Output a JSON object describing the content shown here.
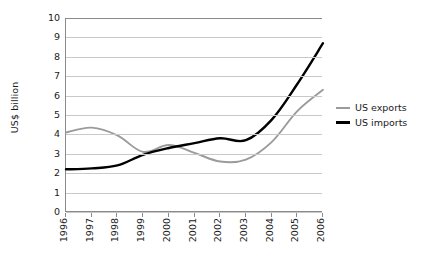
{
  "chart_data": {
    "type": "line",
    "title": "",
    "xlabel": "",
    "ylabel": "US$ billion",
    "categories": [
      "1996",
      "1997",
      "1998",
      "1999",
      "2000",
      "2001",
      "2002",
      "2003",
      "2004",
      "2005",
      "2006"
    ],
    "x": [
      1996,
      1997,
      1998,
      1999,
      2000,
      2001,
      2002,
      2003,
      2004,
      2005,
      2006
    ],
    "series": [
      {
        "name": "US exports",
        "color": "#9b9b9b",
        "values": [
          4.1,
          4.35,
          3.95,
          3.1,
          3.45,
          3.05,
          2.6,
          2.7,
          3.6,
          5.2,
          6.3
        ]
      },
      {
        "name": "US imports",
        "color": "#000000",
        "values": [
          2.2,
          2.25,
          2.4,
          2.95,
          3.3,
          3.55,
          3.8,
          3.7,
          4.75,
          6.6,
          8.7
        ]
      }
    ],
    "ylim": [
      0,
      10
    ],
    "yticks": [
      "0",
      "1",
      "2",
      "3",
      "4",
      "5",
      "6",
      "7",
      "8",
      "9",
      "10"
    ],
    "grid": true,
    "legend_position": "right"
  },
  "legend": {
    "entries": [
      {
        "label": "US exports"
      },
      {
        "label": "US imports"
      }
    ]
  }
}
